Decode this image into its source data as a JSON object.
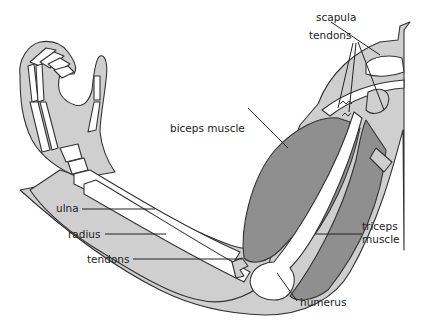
{
  "diagram": {
    "colors": {
      "skin": "#cfcfcf",
      "muscle": "#8f8f8f",
      "bone": "#ffffff",
      "outline": "#333333",
      "background": "#ffffff"
    },
    "labels": {
      "scapula": "scapula",
      "tendons_top": "tendons",
      "biceps": "biceps muscle",
      "ulna": "ulna",
      "radius": "radius",
      "tendons_bottom": "tendons",
      "triceps_line1": "triceps",
      "triceps_line2": "muscle",
      "humerus": "humerus"
    }
  }
}
